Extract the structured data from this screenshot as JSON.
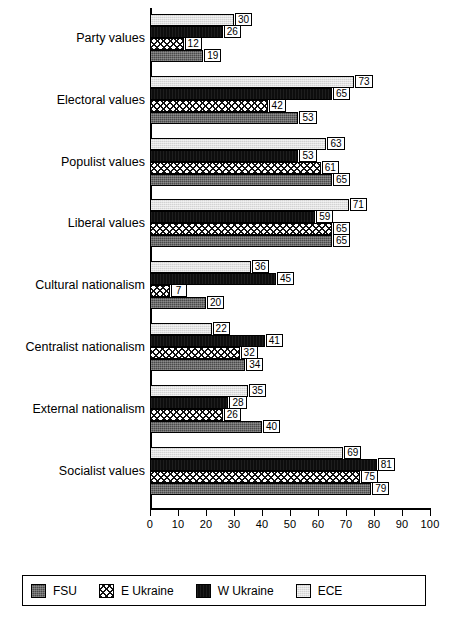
{
  "chart_data": {
    "type": "bar",
    "orientation": "horizontal",
    "title": "",
    "xlabel": "",
    "ylabel": "",
    "xlim": [
      0,
      100
    ],
    "xticks": [
      0,
      10,
      20,
      30,
      40,
      50,
      60,
      70,
      80,
      90,
      100
    ],
    "grid": false,
    "legend_position": "bottom",
    "categories": [
      "Party values",
      "Electoral values",
      "Populist values",
      "Liberal values",
      "Cultural nationalism",
      "Centralist nationalism",
      "External nationalism",
      "Socialist values"
    ],
    "series": [
      {
        "name": "ECE",
        "pattern": "light-grey",
        "color": "#d2d2d2",
        "values": [
          30,
          73,
          63,
          71,
          36,
          22,
          35,
          69
        ]
      },
      {
        "name": "W Ukraine",
        "pattern": "solid-black",
        "color": "#0d0d0d",
        "values": [
          26,
          65,
          53,
          59,
          45,
          41,
          28,
          81
        ]
      },
      {
        "name": "E Ukraine",
        "pattern": "cross-hatch",
        "color": "#ffffff",
        "values": [
          12,
          42,
          61,
          65,
          7,
          32,
          26,
          75
        ]
      },
      {
        "name": "FSU",
        "pattern": "dark-grey-dotted",
        "color": "#4a4a4a",
        "values": [
          19,
          53,
          65,
          65,
          20,
          34,
          40,
          79
        ]
      }
    ]
  },
  "legend": {
    "items": [
      {
        "label": "FSU",
        "swatch": "fsu-swatch-icon"
      },
      {
        "label": "E Ukraine",
        "swatch": "e-ukraine-swatch-icon"
      },
      {
        "label": "W Ukraine",
        "swatch": "w-ukraine-swatch-icon"
      },
      {
        "label": "ECE",
        "swatch": "ece-swatch-icon"
      }
    ]
  }
}
